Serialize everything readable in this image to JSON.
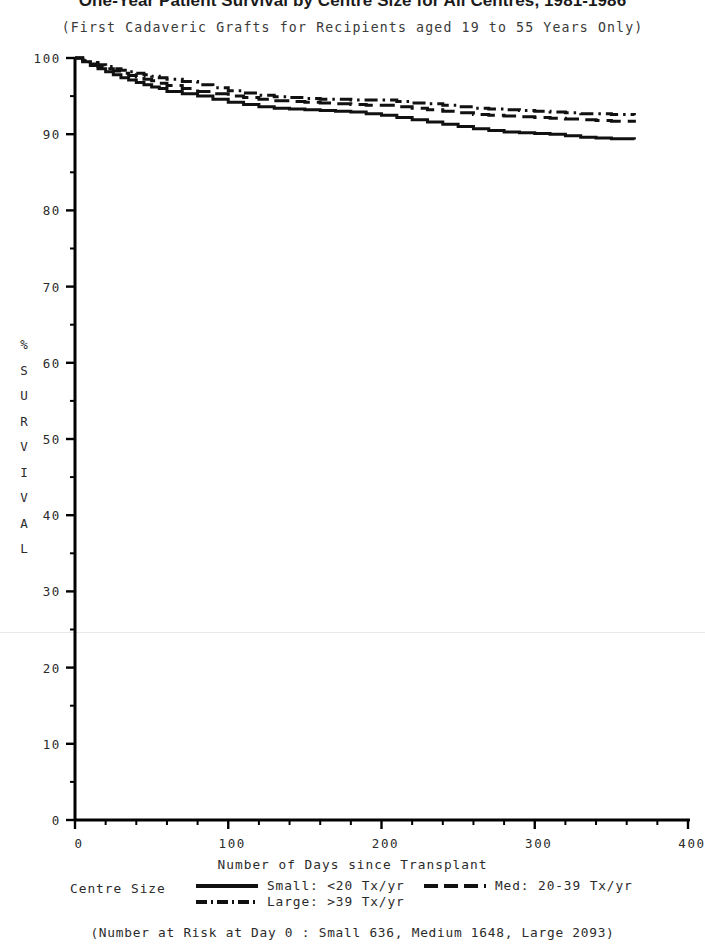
{
  "title": {
    "main": "One-Year Patient Survival by Centre Size for All Centres, 1981-1986",
    "sub": "(First Cadaveric Grafts for Recipients aged 19 to 55 Years Only)"
  },
  "axes": {
    "xlabel": "Number of Days since Transplant",
    "ylabel_letters": [
      "%",
      "S",
      "U",
      "R",
      "V",
      "I",
      "V",
      "A",
      "L"
    ],
    "x_ticks": [
      "0",
      "100",
      "200",
      "300",
      "400"
    ],
    "y_ticks": [
      "0",
      "10",
      "20",
      "30",
      "40",
      "50",
      "60",
      "70",
      "80",
      "90",
      "100"
    ]
  },
  "legend": {
    "title": "Centre Size",
    "entries": [
      {
        "key": "small",
        "label": "Small: <20 Tx/yr",
        "style": "solid"
      },
      {
        "key": "med",
        "label": "Med: 20-39 Tx/yr",
        "style": "dashed"
      },
      {
        "key": "large",
        "label": "Large: >39 Tx/yr",
        "style": "dashdot"
      }
    ]
  },
  "footnote": "(Number at Risk at Day 0 : Small 636, Medium 1648, Large 2093)",
  "colors": {
    "ink": "#111111",
    "axis": "#000000",
    "label": "#2b2b2b",
    "artifact": "#e9e9e9"
  },
  "chart_data": {
    "type": "line",
    "title": "One-Year Patient Survival by Centre Size for All Centres, 1981-1986",
    "subtitle": "(First Cadaveric Grafts for Recipients aged 19 to 55 Years Only)",
    "xlabel": "Number of Days since Transplant",
    "ylabel": "% SURVIVAL",
    "xlim": [
      0,
      400
    ],
    "ylim": [
      0,
      100
    ],
    "x_major_ticks": [
      0,
      100,
      200,
      300,
      400
    ],
    "x_minor_tick_step": 20,
    "y_major_ticks": [
      0,
      10,
      20,
      30,
      40,
      50,
      60,
      70,
      80,
      90,
      100
    ],
    "y_minor_tick_step": 5,
    "grid": false,
    "legend_position": "below-axis",
    "curve_type": "kaplan-meier step",
    "numbers_at_risk_day0": {
      "Small": 636,
      "Medium": 1648,
      "Large": 2093
    },
    "series": [
      {
        "name": "Small: <20 Tx/yr",
        "style": "solid",
        "x": [
          0,
          5,
          10,
          15,
          20,
          25,
          30,
          35,
          40,
          45,
          50,
          55,
          60,
          70,
          80,
          90,
          100,
          110,
          120,
          130,
          140,
          150,
          160,
          170,
          180,
          190,
          200,
          210,
          220,
          230,
          240,
          250,
          260,
          270,
          280,
          290,
          300,
          310,
          320,
          330,
          340,
          350,
          365
        ],
        "y": [
          100.0,
          99.5,
          99.0,
          98.6,
          98.2,
          97.8,
          97.4,
          97.1,
          96.8,
          96.5,
          96.2,
          96.0,
          95.6,
          95.3,
          95.0,
          94.6,
          94.2,
          93.9,
          93.6,
          93.4,
          93.3,
          93.2,
          93.1,
          93.0,
          92.9,
          92.7,
          92.5,
          92.2,
          91.9,
          91.6,
          91.3,
          91.0,
          90.7,
          90.5,
          90.3,
          90.2,
          90.1,
          90.0,
          89.8,
          89.6,
          89.5,
          89.4,
          89.3
        ]
      },
      {
        "name": "Med: 20-39 Tx/yr",
        "style": "dashed",
        "x": [
          0,
          5,
          10,
          15,
          20,
          25,
          30,
          35,
          40,
          45,
          50,
          55,
          60,
          70,
          80,
          90,
          100,
          110,
          120,
          130,
          140,
          150,
          160,
          170,
          180,
          190,
          200,
          210,
          220,
          230,
          240,
          250,
          260,
          270,
          280,
          290,
          300,
          310,
          320,
          330,
          340,
          350,
          365
        ],
        "y": [
          100.0,
          99.6,
          99.2,
          98.9,
          98.6,
          98.3,
          98.0,
          97.7,
          97.5,
          97.2,
          97.0,
          96.7,
          96.4,
          96.0,
          95.6,
          95.3,
          95.0,
          94.8,
          94.6,
          94.4,
          94.3,
          94.2,
          94.1,
          94.0,
          93.9,
          93.8,
          93.8,
          93.6,
          93.4,
          93.2,
          93.0,
          92.8,
          92.6,
          92.5,
          92.4,
          92.3,
          92.2,
          92.1,
          92.0,
          91.9,
          91.8,
          91.7,
          91.5
        ]
      },
      {
        "name": "Large: >39 Tx/yr",
        "style": "dashdot",
        "x": [
          0,
          5,
          10,
          15,
          20,
          25,
          30,
          35,
          40,
          45,
          50,
          55,
          60,
          70,
          80,
          90,
          100,
          110,
          120,
          130,
          140,
          150,
          160,
          170,
          180,
          190,
          200,
          210,
          220,
          230,
          240,
          250,
          260,
          270,
          280,
          290,
          300,
          310,
          320,
          330,
          340,
          350,
          365
        ],
        "y": [
          100.0,
          99.7,
          99.4,
          99.1,
          98.9,
          98.6,
          98.4,
          98.2,
          98.0,
          97.8,
          97.6,
          97.4,
          97.2,
          96.9,
          96.5,
          96.1,
          95.7,
          95.4,
          95.1,
          94.9,
          94.8,
          94.7,
          94.6,
          94.6,
          94.5,
          94.5,
          94.5,
          94.3,
          94.1,
          94.0,
          93.8,
          93.6,
          93.4,
          93.3,
          93.2,
          93.1,
          93.0,
          92.9,
          92.8,
          92.7,
          92.7,
          92.6,
          92.5
        ]
      }
    ]
  }
}
